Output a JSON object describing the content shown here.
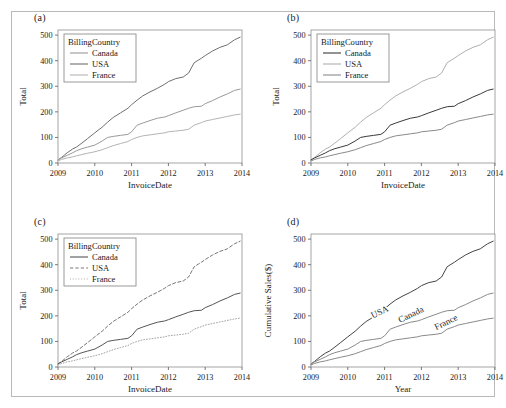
{
  "figure": {
    "panels": [
      {
        "id": "a",
        "label": "(a)"
      },
      {
        "id": "b",
        "label": "(b)"
      },
      {
        "id": "c",
        "label": "(c)"
      },
      {
        "id": "d",
        "label": "(d)"
      }
    ]
  },
  "chart_data": [
    {
      "type": "line",
      "panel": "(a)",
      "title": "",
      "xlabel": "InvoiceDate",
      "ylabel": "Total",
      "xticks": [
        "2009",
        "2010",
        "2011",
        "2012",
        "2013",
        "2014"
      ],
      "yticks": [
        0,
        100,
        200,
        300,
        400,
        500
      ],
      "xlim": [
        2009,
        2014
      ],
      "ylim": [
        0,
        520
      ],
      "grid": false,
      "legend": {
        "title": "BillingCountry",
        "position": "top-left",
        "entries": [
          {
            "name": "Canada",
            "style": "solid",
            "color": "#9a9a9a"
          },
          {
            "name": "USA",
            "style": "solid",
            "color": "#6f6f6f"
          },
          {
            "name": "France",
            "style": "solid",
            "color": "#b4b4b4"
          }
        ]
      },
      "x": [
        2009.0,
        2009.1,
        2009.25,
        2009.4,
        2009.5,
        2009.65,
        2009.8,
        2010.0,
        2010.2,
        2010.35,
        2010.5,
        2010.7,
        2010.9,
        2011.0,
        2011.15,
        2011.3,
        2011.5,
        2011.7,
        2011.9,
        2012.0,
        2012.2,
        2012.4,
        2012.55,
        2012.7,
        2012.9,
        2013.0,
        2013.2,
        2013.4,
        2013.6,
        2013.8,
        2013.95
      ],
      "series": [
        {
          "name": "USA",
          "values": [
            12,
            22,
            40,
            55,
            62,
            78,
            95,
            118,
            140,
            160,
            178,
            196,
            214,
            228,
            246,
            262,
            278,
            292,
            308,
            318,
            330,
            336,
            352,
            392,
            410,
            420,
            438,
            452,
            462,
            482,
            492
          ]
        },
        {
          "name": "Canada",
          "values": [
            12,
            20,
            30,
            40,
            48,
            56,
            62,
            70,
            86,
            100,
            104,
            108,
            112,
            122,
            148,
            156,
            166,
            175,
            180,
            185,
            196,
            206,
            214,
            220,
            222,
            232,
            244,
            258,
            270,
            284,
            289
          ]
        },
        {
          "name": "France",
          "values": [
            8,
            14,
            20,
            24,
            28,
            33,
            38,
            44,
            52,
            60,
            68,
            76,
            84,
            92,
            100,
            106,
            110,
            114,
            118,
            122,
            125,
            128,
            132,
            148,
            158,
            164,
            170,
            176,
            182,
            188,
            191
          ]
        }
      ]
    },
    {
      "type": "line",
      "panel": "(b)",
      "title": "",
      "xlabel": "InvoiceDate",
      "ylabel": "Total",
      "xticks": [
        "2009",
        "2010",
        "2011",
        "2012",
        "2013",
        "2014"
      ],
      "yticks": [
        0,
        100,
        200,
        300,
        400,
        500
      ],
      "xlim": [
        2009,
        2014
      ],
      "ylim": [
        0,
        520
      ],
      "grid": false,
      "legend": {
        "title": "BillingCountry",
        "position": "top-left",
        "entries": [
          {
            "name": "Canada",
            "style": "solid",
            "color": "#3a3a3a"
          },
          {
            "name": "USA",
            "style": "solid",
            "color": "#b0b0b0"
          },
          {
            "name": "France",
            "style": "solid",
            "color": "#8a8a8a"
          }
        ]
      },
      "x": [
        2009.0,
        2009.1,
        2009.25,
        2009.4,
        2009.5,
        2009.65,
        2009.8,
        2010.0,
        2010.2,
        2010.35,
        2010.5,
        2010.7,
        2010.9,
        2011.0,
        2011.15,
        2011.3,
        2011.5,
        2011.7,
        2011.9,
        2012.0,
        2012.2,
        2012.4,
        2012.55,
        2012.7,
        2012.9,
        2013.0,
        2013.2,
        2013.4,
        2013.6,
        2013.8,
        2013.95
      ],
      "series": [
        {
          "name": "USA",
          "values": [
            12,
            22,
            40,
            55,
            62,
            78,
            95,
            118,
            140,
            160,
            178,
            196,
            214,
            228,
            246,
            262,
            278,
            292,
            308,
            318,
            330,
            336,
            352,
            392,
            410,
            420,
            438,
            452,
            462,
            482,
            492
          ]
        },
        {
          "name": "Canada",
          "values": [
            12,
            20,
            30,
            40,
            48,
            56,
            62,
            70,
            86,
            100,
            104,
            108,
            112,
            122,
            148,
            156,
            166,
            175,
            180,
            185,
            196,
            206,
            214,
            220,
            222,
            232,
            244,
            258,
            270,
            284,
            289
          ]
        },
        {
          "name": "France",
          "values": [
            8,
            14,
            20,
            24,
            28,
            33,
            38,
            44,
            52,
            60,
            68,
            76,
            84,
            92,
            100,
            106,
            110,
            114,
            118,
            122,
            125,
            128,
            132,
            148,
            158,
            164,
            170,
            176,
            182,
            188,
            191
          ]
        }
      ]
    },
    {
      "type": "line",
      "panel": "(c)",
      "title": "",
      "xlabel": "InvoiceDate",
      "ylabel": "Total",
      "xticks": [
        "2009",
        "2010",
        "2011",
        "2012",
        "2013",
        "2014"
      ],
      "yticks": [
        0,
        100,
        200,
        300,
        400,
        500
      ],
      "xlim": [
        2009,
        2014
      ],
      "ylim": [
        0,
        520
      ],
      "grid": false,
      "legend": {
        "title": "BillingCountry",
        "position": "top-left",
        "entries": [
          {
            "name": "Canada",
            "style": "solid",
            "color": "#555555"
          },
          {
            "name": "USA",
            "style": "dashed",
            "color": "#777777"
          },
          {
            "name": "France",
            "style": "dotted",
            "color": "#a5a5a5"
          }
        ]
      },
      "x": [
        2009.0,
        2009.1,
        2009.25,
        2009.4,
        2009.5,
        2009.65,
        2009.8,
        2010.0,
        2010.2,
        2010.35,
        2010.5,
        2010.7,
        2010.9,
        2011.0,
        2011.15,
        2011.3,
        2011.5,
        2011.7,
        2011.9,
        2012.0,
        2012.2,
        2012.4,
        2012.55,
        2012.7,
        2012.9,
        2013.0,
        2013.2,
        2013.4,
        2013.6,
        2013.8,
        2013.95
      ],
      "series": [
        {
          "name": "USA",
          "values": [
            12,
            22,
            40,
            55,
            62,
            78,
            95,
            118,
            140,
            160,
            178,
            196,
            214,
            228,
            246,
            262,
            278,
            292,
            308,
            318,
            330,
            336,
            352,
            392,
            410,
            420,
            438,
            452,
            462,
            482,
            492
          ]
        },
        {
          "name": "Canada",
          "values": [
            12,
            20,
            30,
            40,
            48,
            56,
            62,
            70,
            86,
            100,
            104,
            108,
            112,
            122,
            148,
            156,
            166,
            175,
            180,
            185,
            196,
            206,
            214,
            220,
            222,
            232,
            244,
            258,
            270,
            284,
            289
          ]
        },
        {
          "name": "France",
          "values": [
            8,
            14,
            20,
            24,
            28,
            33,
            38,
            44,
            52,
            60,
            68,
            76,
            84,
            92,
            100,
            106,
            110,
            114,
            118,
            122,
            125,
            128,
            132,
            148,
            158,
            164,
            170,
            176,
            182,
            188,
            191
          ]
        }
      ]
    },
    {
      "type": "line",
      "panel": "(d)",
      "title": "",
      "xlabel": "Year",
      "ylabel": "Cumulative Sales($)",
      "xticks": [
        "2009",
        "2010",
        "2011",
        "2012",
        "2013",
        "2014"
      ],
      "yticks": [
        0,
        100,
        200,
        300,
        400,
        500
      ],
      "xlim": [
        2009,
        2014
      ],
      "ylim": [
        0,
        520
      ],
      "grid": false,
      "legend": {
        "title": "",
        "position": "inline-direct-labels",
        "entries": [
          {
            "name": "USA",
            "style": "solid",
            "color": "#444444"
          },
          {
            "name": "Canada",
            "style": "solid",
            "color": "#8a8a8a"
          },
          {
            "name": "France",
            "style": "solid",
            "color": "#8a8a8a"
          }
        ]
      },
      "inline_labels": [
        {
          "text": "USA",
          "x": 2010.9,
          "y": 205
        },
        {
          "text": "Canada",
          "x": 2011.75,
          "y": 195
        },
        {
          "text": "France",
          "x": 2012.7,
          "y": 165
        }
      ],
      "x": [
        2009.0,
        2009.1,
        2009.25,
        2009.4,
        2009.5,
        2009.65,
        2009.8,
        2010.0,
        2010.2,
        2010.35,
        2010.5,
        2010.7,
        2010.9,
        2011.0,
        2011.15,
        2011.3,
        2011.5,
        2011.7,
        2011.9,
        2012.0,
        2012.2,
        2012.4,
        2012.55,
        2012.7,
        2012.9,
        2013.0,
        2013.2,
        2013.4,
        2013.6,
        2013.8,
        2013.95
      ],
      "series": [
        {
          "name": "USA",
          "values": [
            12,
            22,
            40,
            55,
            62,
            78,
            95,
            118,
            140,
            160,
            178,
            196,
            214,
            228,
            246,
            262,
            278,
            292,
            308,
            318,
            330,
            336,
            352,
            392,
            410,
            420,
            438,
            452,
            462,
            482,
            492
          ]
        },
        {
          "name": "Canada",
          "values": [
            12,
            20,
            30,
            40,
            48,
            56,
            62,
            70,
            86,
            100,
            104,
            108,
            112,
            122,
            148,
            156,
            166,
            175,
            180,
            185,
            196,
            206,
            214,
            220,
            222,
            232,
            244,
            258,
            270,
            284,
            289
          ]
        },
        {
          "name": "France",
          "values": [
            8,
            14,
            20,
            24,
            28,
            33,
            38,
            44,
            52,
            60,
            68,
            76,
            84,
            92,
            100,
            106,
            110,
            114,
            118,
            122,
            125,
            128,
            132,
            148,
            158,
            164,
            170,
            176,
            182,
            188,
            191
          ]
        }
      ]
    }
  ]
}
